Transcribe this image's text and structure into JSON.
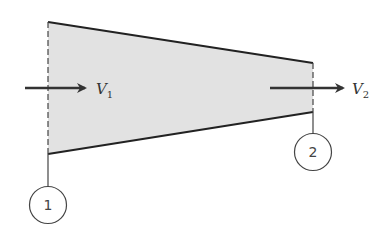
{
  "diagram": {
    "type": "converging nozzle control volume",
    "fill_color": "#e2e2e2",
    "stroke_color": "#222222",
    "inlet": {
      "velocity_label": "V",
      "velocity_subscript": "1",
      "section_label": "1"
    },
    "outlet": {
      "velocity_label": "V",
      "velocity_subscript": "2",
      "section_label": "2"
    }
  }
}
